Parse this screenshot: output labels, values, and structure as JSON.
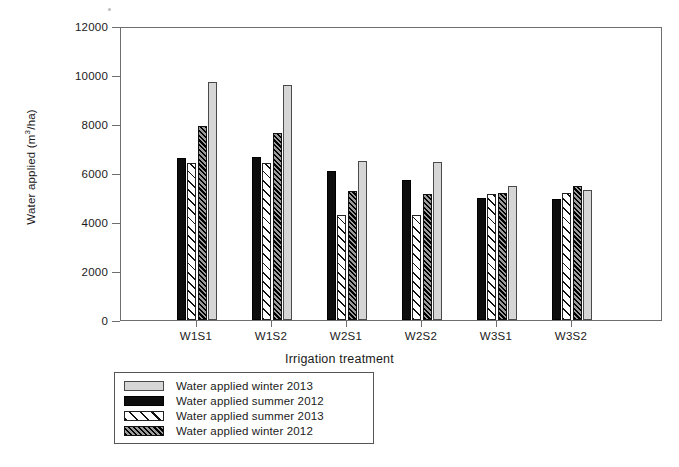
{
  "chart_data": {
    "type": "bar",
    "title": "",
    "xlabel": "Irrigation treatment",
    "ylabel": "Water applied (m3/ha)",
    "ylabel_parts": {
      "pre": "Water applied (m",
      "sup": "3",
      "post": "/ha)"
    },
    "categories": [
      "W1S1",
      "W1S2",
      "W2S1",
      "W2S2",
      "W3S1",
      "W3S2"
    ],
    "ylim": [
      0,
      12000
    ],
    "ytick_labels": [
      "12000",
      "10000",
      "8000",
      "6000",
      "4000",
      "2000",
      "0"
    ],
    "yticks": [
      12000,
      10000,
      8000,
      6000,
      4000,
      2000,
      0
    ],
    "grid": false,
    "legend_position": "below-axes-left",
    "legend_order": [
      "Water applied winter 2013",
      "Water applied summer 2012",
      "Water applied summer 2013",
      "Water applied winter 2012"
    ],
    "series": [
      {
        "name": "Water applied summer 2012",
        "key": "summer2012",
        "style": "solid-black",
        "color": "#0d0d0d",
        "draw_order": 1,
        "values": [
          6600,
          6650,
          6100,
          5700,
          5000,
          4950
        ]
      },
      {
        "name": "Water applied summer 2013",
        "key": "summer2013",
        "style": "white-diagonal-hatch",
        "color": "#ffffff",
        "draw_order": 2,
        "values": [
          6400,
          6400,
          4300,
          4300,
          5150,
          5200
        ]
      },
      {
        "name": "Water applied winter 2012",
        "key": "winter2012",
        "style": "dark-dense-hatch",
        "color": "#3d3d3d",
        "draw_order": 3,
        "values": [
          7900,
          7650,
          5250,
          5150,
          5200,
          5450
        ]
      },
      {
        "name": "Water applied winter 2013",
        "key": "winter2013",
        "style": "light-gray-fill",
        "color": "#d6d6d6",
        "draw_order": 4,
        "values": [
          9700,
          9600,
          6500,
          6450,
          5450,
          5300
        ]
      }
    ]
  },
  "legend": {
    "items": [
      {
        "label": "Water applied winter 2013",
        "swatch": "sw-winter2013"
      },
      {
        "label": "Water applied summer 2012",
        "swatch": "sw-summer2012"
      },
      {
        "label": "Water applied summer 2013",
        "swatch": "sw-summer2013"
      },
      {
        "label": "Water applied winter 2012",
        "swatch": "sw-winter2012"
      }
    ]
  }
}
